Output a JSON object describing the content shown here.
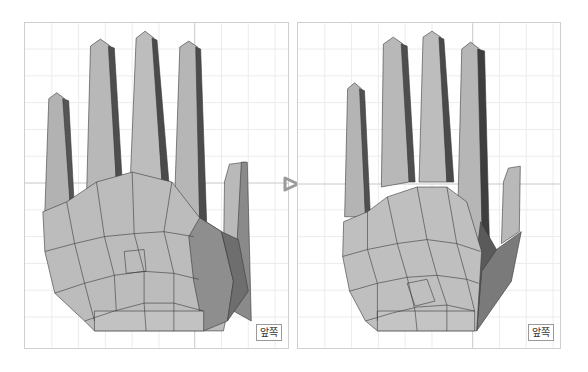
{
  "viewports": [
    {
      "id": "before",
      "label": "앞쪽",
      "description": "Hand mesh before smoothing"
    },
    {
      "id": "after",
      "label": "앞쪽",
      "description": "Hand mesh after smoothing"
    }
  ],
  "transition_icon": "arrow-right-outline-icon",
  "colors": {
    "mesh_light": "#bdbdbd",
    "mesh_mid": "#a6a6a6",
    "mesh_dark": "#5e5e5e",
    "edge": "#3a3a3a",
    "grid": "#ececec",
    "crosshair": "#c8c8c8",
    "arrow": "#9a9a9a"
  }
}
